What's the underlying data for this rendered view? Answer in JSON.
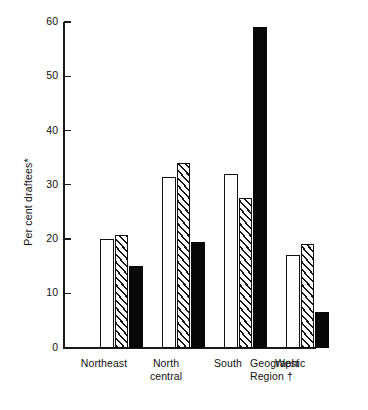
{
  "chart_data": {
    "type": "bar",
    "title": "",
    "xlabel": "Geographic Region †",
    "ylabel": "Per cent draftees*",
    "categories": [
      "Northeast",
      "North central",
      "South",
      "West"
    ],
    "ylim": [
      0,
      60
    ],
    "yticks": [
      0,
      10,
      20,
      30,
      40,
      50,
      60
    ],
    "grid": false,
    "legend": "none",
    "series": [
      {
        "name": "open-bar",
        "pattern": "open",
        "values": [
          20.0,
          31.5,
          32.0,
          17.0
        ]
      },
      {
        "name": "hatched-bar",
        "pattern": "hatched",
        "values": [
          20.8,
          34.0,
          27.5,
          19.0
        ]
      },
      {
        "name": "solid-bar",
        "pattern": "solid",
        "values": [
          15.0,
          19.5,
          59.0,
          6.5
        ]
      }
    ]
  },
  "axis": {
    "y_title": "Per cent draftees*",
    "tick_labels": [
      "60",
      "50",
      "40",
      "30",
      "20",
      "10",
      "0"
    ],
    "caption_line1": "Geographic",
    "caption_line2": "Region †"
  },
  "categories": {
    "northeast": {
      "line1": "Northeast",
      "line2": ""
    },
    "north_central": {
      "line1": "North",
      "line2": "central"
    },
    "south": {
      "line1": "South",
      "line2": ""
    },
    "west": {
      "line1": "West",
      "line2": ""
    }
  }
}
